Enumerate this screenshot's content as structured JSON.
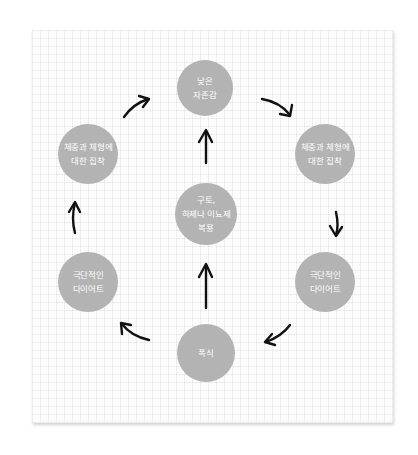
{
  "diagram": {
    "type": "cycle",
    "colors": {
      "node_fill": "#b3b3b3",
      "node_text": "#ffffff",
      "arrow": "#111111",
      "grid_line": "#e8e8e8",
      "background": "#fcfcfc"
    },
    "nodes": {
      "low_self_esteem": {
        "line1": "낮은",
        "line2": "자존감"
      },
      "obsession_right": {
        "line1": "체중과 체형에",
        "line2": "대한 집착"
      },
      "extreme_diet_right": {
        "line1": "극단적인",
        "line2": "다이어트"
      },
      "binge_eating": {
        "line1": "폭식"
      },
      "extreme_diet_left": {
        "line1": "극단적인",
        "line2": "다이어트"
      },
      "obsession_left": {
        "line1": "체중과 체형에",
        "line2": "대한 집착"
      },
      "purging": {
        "line1": "구토,",
        "line2": "하제나 이뇨제",
        "line3": "복용"
      }
    },
    "edges": [
      {
        "from": "low_self_esteem",
        "to": "obsession_right"
      },
      {
        "from": "obsession_right",
        "to": "extreme_diet_right"
      },
      {
        "from": "extreme_diet_right",
        "to": "binge_eating"
      },
      {
        "from": "binge_eating",
        "to": "extreme_diet_left"
      },
      {
        "from": "extreme_diet_left",
        "to": "obsession_left"
      },
      {
        "from": "obsession_left",
        "to": "low_self_esteem"
      },
      {
        "from": "binge_eating",
        "to": "purging"
      },
      {
        "from": "purging",
        "to": "low_self_esteem"
      }
    ]
  }
}
